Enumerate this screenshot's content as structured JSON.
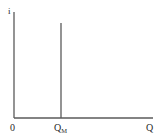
{
  "diagram": {
    "y_axis_label": "i",
    "x_axis_label": "Q",
    "origin_label": "0",
    "marker_label_main": "Q",
    "marker_label_sub": "M",
    "colors": {
      "line": "#5a5a5a",
      "text": "#2a2a2a",
      "background": "#ffffff"
    }
  }
}
